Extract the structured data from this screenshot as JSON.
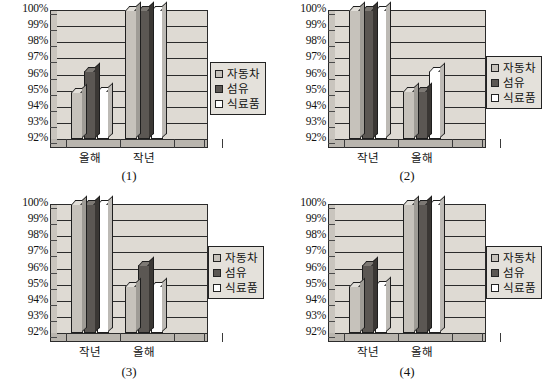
{
  "legend": {
    "items": [
      {
        "label": "자동차",
        "swatch": "light-gray",
        "color": "#c6c2bb"
      },
      {
        "label": "섬유",
        "swatch": "dark-gray",
        "color": "#5b5753"
      },
      {
        "label": "식료품",
        "swatch": "white",
        "color": "#ffffff"
      }
    ]
  },
  "axis": {
    "ticks": [
      "100%",
      "99%",
      "98%",
      "97%",
      "96%",
      "95%",
      "94%",
      "93%",
      "92%"
    ],
    "min": 92,
    "max": 100,
    "step": 1
  },
  "panels": [
    {
      "caption": "(1)",
      "categories": [
        "올해",
        "작년"
      ]
    },
    {
      "caption": "(2)",
      "categories": [
        "작년",
        "올해"
      ]
    },
    {
      "caption": "(3)",
      "categories": [
        "작년",
        "올해"
      ]
    },
    {
      "caption": "(4)",
      "categories": [
        "작년",
        "올해"
      ]
    }
  ],
  "chart_data": [
    {
      "type": "bar",
      "title": "(1)",
      "categories": [
        "올해",
        "작년"
      ],
      "series": [
        {
          "name": "자동차",
          "values": [
            94.9,
            100
          ]
        },
        {
          "name": "섬유",
          "values": [
            96.2,
            100
          ]
        },
        {
          "name": "식료품",
          "values": [
            95.0,
            100
          ]
        }
      ],
      "xlabel": "",
      "ylabel": "",
      "ylim": [
        92,
        100
      ],
      "ytick_labels": [
        "92%",
        "93%",
        "94%",
        "95%",
        "96%",
        "97%",
        "98%",
        "99%",
        "100%"
      ],
      "grid": true,
      "legend_position": "right"
    },
    {
      "type": "bar",
      "title": "(2)",
      "categories": [
        "작년",
        "올해"
      ],
      "series": [
        {
          "name": "자동차",
          "values": [
            100,
            95.0
          ]
        },
        {
          "name": "섬유",
          "values": [
            100,
            95.0
          ]
        },
        {
          "name": "식료품",
          "values": [
            100,
            96.2
          ]
        }
      ],
      "xlabel": "",
      "ylabel": "",
      "ylim": [
        92,
        100
      ],
      "ytick_labels": [
        "92%",
        "93%",
        "94%",
        "95%",
        "96%",
        "97%",
        "98%",
        "99%",
        "100%"
      ],
      "grid": true,
      "legend_position": "right"
    },
    {
      "type": "bar",
      "title": "(3)",
      "categories": [
        "작년",
        "올해"
      ],
      "series": [
        {
          "name": "자동차",
          "values": [
            100,
            94.9
          ]
        },
        {
          "name": "섬유",
          "values": [
            100,
            96.2
          ]
        },
        {
          "name": "식료품",
          "values": [
            100,
            94.9
          ]
        }
      ],
      "xlabel": "",
      "ylabel": "",
      "ylim": [
        92,
        100
      ],
      "ytick_labels": [
        "92%",
        "93%",
        "94%",
        "95%",
        "96%",
        "97%",
        "98%",
        "99%",
        "100%"
      ],
      "grid": true,
      "legend_position": "right"
    },
    {
      "type": "bar",
      "title": "(4)",
      "categories": [
        "작년",
        "올해"
      ],
      "series": [
        {
          "name": "자동차",
          "values": [
            94.9,
            100
          ]
        },
        {
          "name": "섬유",
          "values": [
            96.2,
            100
          ]
        },
        {
          "name": "식료품",
          "values": [
            95.0,
            100
          ]
        }
      ],
      "xlabel": "",
      "ylabel": "",
      "ylim": [
        92,
        100
      ],
      "ytick_labels": [
        "92%",
        "93%",
        "94%",
        "95%",
        "96%",
        "97%",
        "98%",
        "99%",
        "100%"
      ],
      "grid": true,
      "legend_position": "right"
    }
  ]
}
